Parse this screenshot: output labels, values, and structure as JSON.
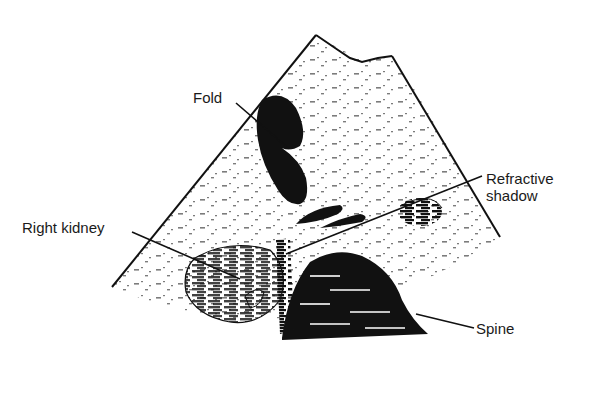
{
  "figure": {
    "type": "ultrasound sector scan illustration",
    "colors": {
      "ink": "#111111",
      "background": "#ffffff"
    },
    "labels": [
      {
        "id": "fold",
        "text": "Fold"
      },
      {
        "id": "refractive-shadow",
        "text": "Refractive\nshadow"
      },
      {
        "id": "right-kidney",
        "text": "Right kidney"
      },
      {
        "id": "spine",
        "text": "Spine"
      }
    ]
  }
}
